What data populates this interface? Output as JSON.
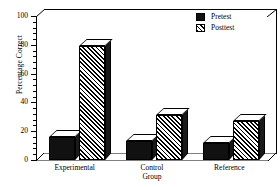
{
  "chart_data": {
    "type": "bar",
    "title": "",
    "xlabel": "Group",
    "ylabel": "Percentage Correct",
    "categories": [
      "Experimental",
      "Control",
      "Reference"
    ],
    "series": [
      {
        "name": "Pretest",
        "values": [
          16,
          13,
          12
        ],
        "fill": "solid"
      },
      {
        "name": "Posttest",
        "values": [
          79,
          31,
          27
        ],
        "fill": "hatch"
      }
    ],
    "ylim": [
      0,
      100
    ],
    "yticks": [
      0,
      20,
      40,
      60,
      80,
      100
    ],
    "ytick_labels": [
      "0",
      "20",
      "40",
      "60",
      "80",
      "100"
    ],
    "minor_ticks_per_interval": 4,
    "grid": false,
    "legend_position": "top-right",
    "style": "3d-shaded-bars",
    "colors": {
      "pretest": "#111111",
      "posttest_hatch": "#000000",
      "background": "#ffffff",
      "axis": "#000000"
    }
  },
  "legend": {
    "entries": [
      {
        "label": "Pretest"
      },
      {
        "label": "Posttest"
      }
    ]
  },
  "axis": {
    "y_title": "Percentage Correct",
    "x_title": "Group"
  }
}
